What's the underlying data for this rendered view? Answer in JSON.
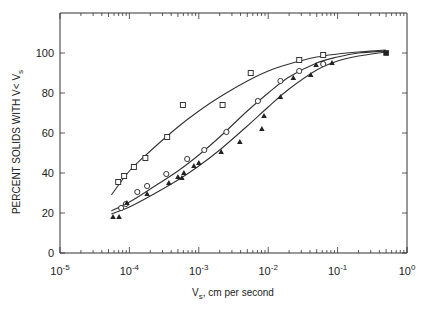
{
  "chart_data": {
    "type": "scatter",
    "title": "",
    "xlabel": "V_s, cm per second",
    "xlabel_main": "V",
    "xlabel_sub": "s",
    "xlabel_rest": ", cm per second",
    "ylabel": "PERCENT SOLIDS WITH V< V_s",
    "ylabel_main": "PERCENT SOLIDS WITH V< V",
    "ylabel_sub": "s",
    "xscale": "log",
    "xlim": [
      1e-05,
      1
    ],
    "ylim": [
      0,
      120
    ],
    "grid": false,
    "legend": null,
    "x_ticks": [
      {
        "value": 1e-05,
        "base": "10",
        "exp": "-5"
      },
      {
        "value": 0.0001,
        "base": "10",
        "exp": "-4"
      },
      {
        "value": 0.001,
        "base": "10",
        "exp": "-3"
      },
      {
        "value": 0.01,
        "base": "10",
        "exp": "-2"
      },
      {
        "value": 0.1,
        "base": "10",
        "exp": "-1"
      },
      {
        "value": 1,
        "base": "10",
        "exp": "0"
      }
    ],
    "y_ticks": [
      {
        "value": 0,
        "label": "0"
      },
      {
        "value": 20,
        "label": "20"
      },
      {
        "value": 40,
        "label": "40"
      },
      {
        "value": 60,
        "label": "60"
      },
      {
        "value": 80,
        "label": "80"
      },
      {
        "value": 100,
        "label": "100"
      }
    ],
    "series": [
      {
        "name": "squares",
        "marker": "open-square",
        "points": [
          [
            6.9e-05,
            35.5
          ],
          [
            8.4e-05,
            38.5
          ],
          [
            0.000116,
            43
          ],
          [
            0.00017,
            47.5
          ],
          [
            0.00035,
            58
          ],
          [
            0.00059,
            74
          ],
          [
            0.0022,
            74
          ],
          [
            0.0056,
            90
          ],
          [
            0.028,
            96.5
          ],
          [
            0.062,
            99
          ]
        ]
      },
      {
        "name": "circles",
        "marker": "open-circle",
        "points": [
          [
            7.6e-05,
            22.5
          ],
          [
            8.9e-05,
            24.5
          ],
          [
            0.00013,
            30.5
          ],
          [
            0.00018,
            33.5
          ],
          [
            0.00034,
            39.5
          ],
          [
            0.00068,
            47
          ],
          [
            0.0012,
            51.5
          ],
          [
            0.0025,
            60.5
          ],
          [
            0.0071,
            76
          ],
          [
            0.015,
            86
          ],
          [
            0.028,
            91
          ],
          [
            0.062,
            94.5
          ]
        ]
      },
      {
        "name": "triangles",
        "marker": "filled-triangle",
        "points": [
          [
            5.8e-05,
            18
          ],
          [
            7.1e-05,
            18
          ],
          [
            9.2e-05,
            25
          ],
          [
            0.00018,
            29.5
          ],
          [
            0.00037,
            35
          ],
          [
            0.0005,
            38
          ],
          [
            0.00057,
            37.5
          ],
          [
            0.00061,
            40
          ],
          [
            0.00085,
            43.5
          ],
          [
            0.001,
            45
          ],
          [
            0.0021,
            50.5
          ],
          [
            0.0039,
            55.5
          ],
          [
            0.0081,
            62
          ],
          [
            0.0087,
            68.5
          ],
          [
            0.015,
            78
          ],
          [
            0.023,
            87.5
          ],
          [
            0.041,
            89
          ],
          [
            0.049,
            94
          ],
          [
            0.083,
            95
          ]
        ]
      },
      {
        "name": "common-endpoint",
        "marker": "filled-square",
        "points": [
          [
            0.5,
            100
          ]
        ]
      }
    ],
    "fit_curves": [
      {
        "name": "squares-fit",
        "points": [
          [
            5.5e-05,
            29
          ],
          [
            0.0001,
            41
          ],
          [
            0.0002,
            51
          ],
          [
            0.0005,
            63
          ],
          [
            0.001,
            71
          ],
          [
            0.002,
            78
          ],
          [
            0.005,
            86
          ],
          [
            0.01,
            91
          ],
          [
            0.02,
            94.5
          ],
          [
            0.05,
            98
          ],
          [
            0.1,
            99.5
          ],
          [
            0.2,
            100.5
          ],
          [
            0.5,
            101.5
          ]
        ]
      },
      {
        "name": "circles-fit",
        "points": [
          [
            5.5e-05,
            21
          ],
          [
            0.0001,
            25.5
          ],
          [
            0.0002,
            32
          ],
          [
            0.0005,
            41
          ],
          [
            0.001,
            49
          ],
          [
            0.002,
            58
          ],
          [
            0.005,
            71
          ],
          [
            0.01,
            80
          ],
          [
            0.02,
            88
          ],
          [
            0.05,
            95
          ],
          [
            0.1,
            98
          ],
          [
            0.2,
            100
          ],
          [
            0.5,
            101
          ]
        ]
      },
      {
        "name": "triangles-fit",
        "points": [
          [
            5.5e-05,
            19.5
          ],
          [
            0.0001,
            23
          ],
          [
            0.0002,
            28.5
          ],
          [
            0.0005,
            36.5
          ],
          [
            0.001,
            43.5
          ],
          [
            0.002,
            51.5
          ],
          [
            0.005,
            63.5
          ],
          [
            0.01,
            73
          ],
          [
            0.02,
            82
          ],
          [
            0.05,
            91.5
          ],
          [
            0.1,
            96
          ],
          [
            0.2,
            98.5
          ],
          [
            0.5,
            100.5
          ]
        ]
      }
    ]
  },
  "layout": {
    "plot_left": 60,
    "plot_right": 407,
    "plot_top": 13,
    "plot_bottom": 253,
    "line_color": "#333333",
    "marker_color": "#222222"
  }
}
